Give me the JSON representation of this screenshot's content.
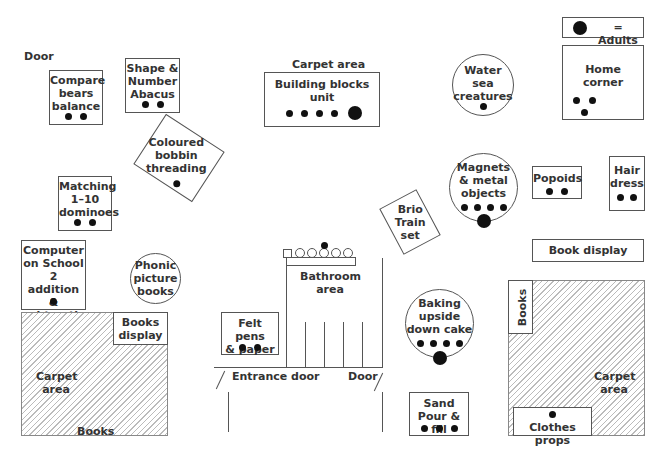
{
  "legend": {
    "symbol": "large-dot",
    "label": "= Adults"
  },
  "labels": {
    "door_top": "Door",
    "carpet_top": "Carpet area",
    "entrance_door": "Entrance door",
    "door_bottom": "Door",
    "bathroom": "Bathroom area",
    "carpet_left": "Carpet area",
    "books_left": "Books",
    "carpet_right": "Carpet area"
  },
  "stations": [
    {
      "id": "compare-bears",
      "label": "Compare bears balance",
      "children": 2,
      "adults": 0,
      "shape": "rect"
    },
    {
      "id": "shape-number-abacus",
      "label": "Shape & Number Abacus",
      "children": 2,
      "adults": 0,
      "shape": "rect"
    },
    {
      "id": "building-blocks",
      "label": "Building blocks unit",
      "children": 4,
      "adults": 1,
      "shape": "rect"
    },
    {
      "id": "water-sea-creatures",
      "label": "Water sea creatures",
      "children": 1,
      "adults": 0,
      "shape": "circle"
    },
    {
      "id": "home-corner",
      "label": "Home corner",
      "children": 3,
      "adults": 0,
      "shape": "rect"
    },
    {
      "id": "coloured-bobbin",
      "label": "Coloured bobbin threading",
      "children": 1,
      "adults": 0,
      "shape": "rotated-rect"
    },
    {
      "id": "matching-dominoes",
      "label": "Matching 1–10 dominoes",
      "children": 2,
      "adults": 0,
      "shape": "rect"
    },
    {
      "id": "magnets",
      "label": "Magnets & metal objects",
      "children": 4,
      "adults": 1,
      "shape": "circle"
    },
    {
      "id": "popoids",
      "label": "Popoids",
      "children": 2,
      "adults": 0,
      "shape": "rect"
    },
    {
      "id": "hair-dress",
      "label": "Hair dress",
      "children": 2,
      "adults": 0,
      "shape": "rect"
    },
    {
      "id": "brio-train",
      "label": "Brio Train set",
      "children": 0,
      "adults": 0,
      "shape": "rotated-rect"
    },
    {
      "id": "book-display-right",
      "label": "Book display",
      "children": 0,
      "adults": 0,
      "shape": "rect"
    },
    {
      "id": "computer",
      "label": "Computer on School 2 addition & subtraction",
      "children": 1,
      "adults": 0,
      "shape": "rect"
    },
    {
      "id": "phonic-books",
      "label": "Phonic picture books",
      "children": 0,
      "adults": 0,
      "shape": "circle"
    },
    {
      "id": "bathroom",
      "label": "Bathroom area",
      "children": 1,
      "adults": 0,
      "shape": "area"
    },
    {
      "id": "felt-pens",
      "label": "Felt pens & paper",
      "children": 2,
      "adults": 0,
      "shape": "rect"
    },
    {
      "id": "books-display-left",
      "label": "Books display",
      "children": 0,
      "adults": 0,
      "shape": "rect"
    },
    {
      "id": "baking",
      "label": "Baking upside down cake",
      "children": 4,
      "adults": 1,
      "shape": "circle"
    },
    {
      "id": "books-right",
      "label": "Books",
      "children": 0,
      "adults": 0,
      "shape": "rect-vertical"
    },
    {
      "id": "sand",
      "label": "Sand Pour & fill",
      "children": 3,
      "adults": 0,
      "shape": "rect"
    },
    {
      "id": "clothes-props",
      "label": "Clothes props",
      "children": 1,
      "adults": 0,
      "shape": "rect"
    }
  ],
  "text": {
    "compare": [
      "Compare",
      "bears",
      "balance"
    ],
    "abacus": [
      "Shape &",
      "Number",
      "Abacus"
    ],
    "blocks": [
      "Building blocks",
      "unit"
    ],
    "water": [
      "Water",
      "sea",
      "creatures"
    ],
    "home": [
      "Home",
      "corner"
    ],
    "bobbin": [
      "Coloured",
      "bobbin",
      "threading"
    ],
    "dominoes": [
      "Matching",
      "1–10",
      "dominoes"
    ],
    "magnets": [
      "Magnets",
      "& metal",
      "objects"
    ],
    "popoids": "Popoids",
    "hair": [
      "Hair",
      "dress"
    ],
    "brio": [
      "Brio",
      "Train",
      "set"
    ],
    "bookdisplay": "Book display",
    "computer": [
      "Computer",
      "on School 2",
      "addition &",
      "subtraction"
    ],
    "phonic": [
      "Phonic",
      "picture",
      "books"
    ],
    "felt": [
      "Felt pens",
      "& paper"
    ],
    "booksdisplay": [
      "Books",
      "display"
    ],
    "baking": [
      "Baking",
      "upside",
      "down cake"
    ],
    "booksright": "Books",
    "sand": [
      "Sand",
      "Pour & fill"
    ],
    "clothes": "Clothes props"
  }
}
